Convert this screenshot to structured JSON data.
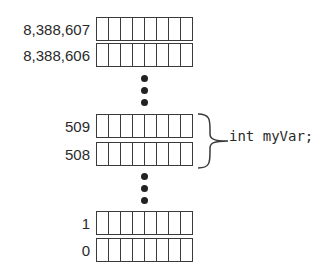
{
  "memory": {
    "rows": [
      {
        "address": "8,388,607",
        "top": 17
      },
      {
        "address": "8,388,606",
        "top": 43
      },
      {
        "address": "509",
        "top": 114
      },
      {
        "address": "508",
        "top": 142
      },
      {
        "address": "1",
        "top": 211
      },
      {
        "address": "0",
        "top": 238
      }
    ],
    "bits_per_row": 8,
    "ellipsis_groups": [
      [
        78,
        90,
        102
      ],
      [
        176,
        188,
        200
      ]
    ]
  },
  "annotation": {
    "variable": "int myVar;",
    "spans_rows": [
      "509",
      "508"
    ]
  }
}
